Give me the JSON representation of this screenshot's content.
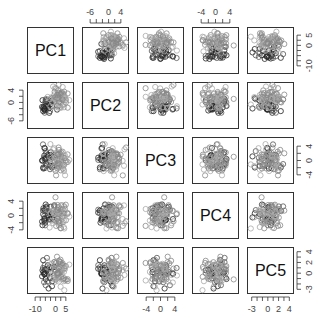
{
  "chart_data": {
    "type": "scatter",
    "kind": "pairs-plot",
    "variables": [
      "PC1",
      "PC2",
      "PC3",
      "PC4",
      "PC5"
    ],
    "axes": {
      "PC1": {
        "range": [
          -13,
          8
        ],
        "ticks": [
          -10,
          0,
          5
        ],
        "tick_labels": [
          "-10",
          "0",
          "5"
        ]
      },
      "PC2": {
        "range": [
          -8,
          6
        ],
        "ticks": [
          -6,
          0,
          4
        ],
        "tick_labels": [
          "-6",
          "0",
          "4"
        ]
      },
      "PC3": {
        "range": [
          -6,
          6
        ],
        "ticks": [
          -4,
          0,
          4
        ],
        "tick_labels": [
          "-4",
          "0",
          "4"
        ]
      },
      "PC4": {
        "range": [
          -6,
          6
        ],
        "ticks": [
          -4,
          0,
          4
        ],
        "tick_labels": [
          "-4",
          "0",
          "4"
        ]
      },
      "PC5": {
        "range": [
          -3.5,
          4.5
        ],
        "ticks": [
          -3,
          0,
          2,
          4
        ],
        "tick_labels": [
          "-3",
          "0",
          "2",
          "4"
        ]
      }
    },
    "axis_placement": {
      "top": [
        "PC2",
        "PC4"
      ],
      "bottom": [
        "PC1",
        "PC3",
        "PC5"
      ],
      "left": [
        "PC2",
        "PC4"
      ],
      "right": [
        "PC1",
        "PC3",
        "PC5"
      ]
    },
    "marker": "open-circle",
    "point_colors": [
      "#222222",
      "#555555",
      "#888888",
      "#aaaaaa"
    ],
    "n_points_approx": 100,
    "grid": false,
    "legend": null
  }
}
